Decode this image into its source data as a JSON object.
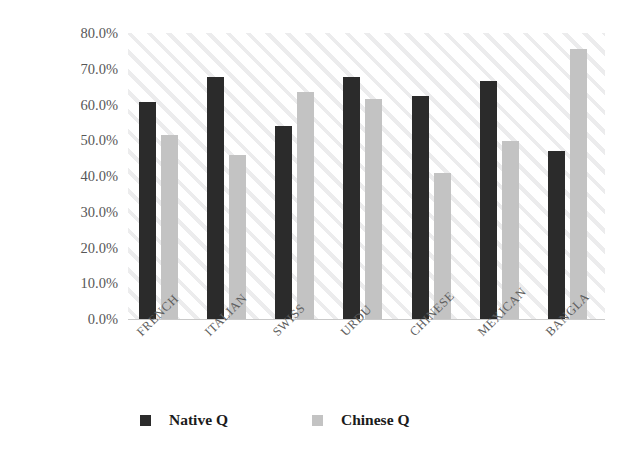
{
  "chart_data": {
    "type": "bar",
    "title": "",
    "xlabel": "",
    "ylabel": "Native Charger Choice",
    "categories": [
      "FRENCH",
      "ITALIAN",
      "SWISS",
      "URDU",
      "CHINESE",
      "MEXICAN",
      "BANGLA"
    ],
    "series": [
      {
        "name": "Native Q",
        "color": "#2b2b2b",
        "values": [
          60.8,
          67.6,
          54.0,
          67.8,
          62.5,
          66.5,
          46.9
        ]
      },
      {
        "name": "Chinese Q",
        "color": "#c3c3c3",
        "values": [
          51.5,
          46.0,
          63.5,
          61.5,
          40.8,
          49.8,
          75.5
        ]
      }
    ],
    "ylim": [
      0,
      80
    ],
    "ytick_values": [
      0,
      10,
      20,
      30,
      40,
      50,
      60,
      70,
      80
    ],
    "ytick_labels": [
      "0.0%",
      "10.0%",
      "20.0%",
      "30.0%",
      "40.0%",
      "50.0%",
      "60.0%",
      "70.0%",
      "80.0%"
    ],
    "grid": false,
    "plot_background": "diagonal-hatch-light-gray",
    "legend_position": "bottom"
  },
  "legend": {
    "items": [
      {
        "label": "Native Q",
        "swatch": "native"
      },
      {
        "label": "Chinese Q",
        "swatch": "chinese"
      }
    ]
  },
  "colors": {
    "native_bar": "#2b2b2b",
    "chinese_bar": "#c3c3c3",
    "tick_label": "#575757",
    "axis_title": "#1b1b1b",
    "hatch": "#ececed"
  }
}
